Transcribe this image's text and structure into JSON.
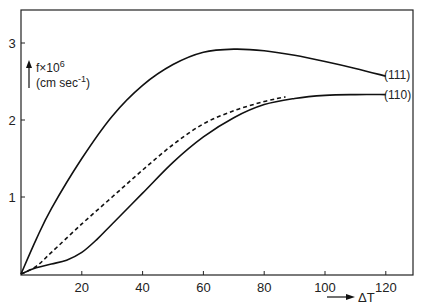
{
  "chart_data": {
    "type": "line",
    "title": "",
    "xlabel": "ΔT",
    "ylabel": "f×10^6 (cm sec^-1)",
    "ylabel_line1": "f×10",
    "ylabel_sup1": "6",
    "ylabel_line2": "(cm sec",
    "ylabel_sup2": "-1",
    "ylabel_close": ")",
    "xlim": [
      0,
      128
    ],
    "ylim": [
      0,
      3.4
    ],
    "x_ticks": [
      "20",
      "40",
      "60",
      "80",
      "100",
      "120"
    ],
    "y_ticks": [
      "1",
      "2",
      "3"
    ],
    "grid": false,
    "series": [
      {
        "name": "(111)",
        "style": "solid",
        "x": [
          0,
          5,
          10,
          20,
          30,
          40,
          50,
          60,
          70,
          80,
          90,
          100,
          110,
          120
        ],
        "y": [
          0,
          0.45,
          0.85,
          1.5,
          2.05,
          2.45,
          2.72,
          2.88,
          2.92,
          2.9,
          2.84,
          2.76,
          2.67,
          2.57
        ]
      },
      {
        "name": "(110)",
        "style": "solid",
        "x": [
          0,
          5,
          10,
          15,
          20,
          25,
          30,
          40,
          50,
          60,
          70,
          80,
          90,
          100,
          110,
          120
        ],
        "y": [
          0,
          0.08,
          0.13,
          0.18,
          0.28,
          0.45,
          0.65,
          1.05,
          1.45,
          1.78,
          2.03,
          2.2,
          2.28,
          2.32,
          2.33,
          2.33
        ]
      },
      {
        "name": "dashed",
        "style": "dashed",
        "x": [
          0,
          5,
          10,
          20,
          30,
          40,
          50,
          60,
          70,
          80,
          87
        ],
        "y": [
          0,
          0.1,
          0.28,
          0.65,
          1.0,
          1.35,
          1.68,
          1.95,
          2.12,
          2.24,
          2.3
        ]
      }
    ],
    "annotations": [
      "(111)",
      "(110)"
    ]
  }
}
